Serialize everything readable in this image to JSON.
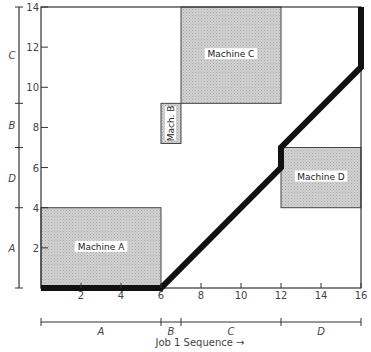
{
  "chart_data": {
    "type": "diagram",
    "title": "",
    "xlabel": "Job 1 Sequence →",
    "ylabel": "",
    "xlim": [
      0,
      16
    ],
    "ylim": [
      0,
      14
    ],
    "x_ticks": [
      2,
      4,
      6,
      8,
      10,
      12,
      14,
      16
    ],
    "y_ticks": [
      2,
      4,
      6,
      8,
      10,
      12,
      14
    ],
    "machines": [
      {
        "name": "Machine A",
        "label": "Machine A",
        "x0": 0,
        "x1": 6,
        "y0": 0,
        "y1": 4
      },
      {
        "name": "Machine B",
        "label": "Mach. B",
        "x0": 6,
        "x1": 7,
        "y0": 7.2,
        "y1": 9.2
      },
      {
        "name": "Machine C",
        "label": "Machine C",
        "x0": 7,
        "x1": 12,
        "y0": 9.2,
        "y1": 14
      },
      {
        "name": "Machine D",
        "label": "Machine D",
        "x0": 12,
        "x1": 16,
        "y0": 4,
        "y1": 7
      }
    ],
    "x_sequence": [
      {
        "label": "A",
        "start": 0,
        "end": 6
      },
      {
        "label": "B",
        "start": 6,
        "end": 7
      },
      {
        "label": "C",
        "start": 7,
        "end": 12
      },
      {
        "label": "D",
        "start": 12,
        "end": 16
      }
    ],
    "y_sequence": [
      {
        "label": "A",
        "start": 0,
        "end": 4
      },
      {
        "label": "D",
        "start": 4,
        "end": 7
      },
      {
        "label": "B",
        "start": 7,
        "end": 9.2
      },
      {
        "label": "C",
        "start": 9.2,
        "end": 14
      }
    ],
    "path": [
      [
        0,
        0
      ],
      [
        6,
        0
      ],
      [
        12,
        6
      ],
      [
        12,
        7
      ],
      [
        16,
        11
      ],
      [
        16,
        14
      ]
    ]
  },
  "colors": {
    "box_fill": "#c8c8c8",
    "path": "#111111",
    "axis": "#333333"
  }
}
